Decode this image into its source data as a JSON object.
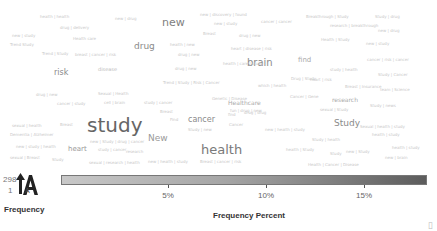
{
  "chart_data": {
    "type": "wordcloud",
    "title": "",
    "words": [
      {
        "text": "study",
        "size": 20,
        "color": "#666666",
        "x": 87,
        "y": 115
      },
      {
        "text": "health",
        "size": 13,
        "color": "#7a7a7a",
        "x": 201,
        "y": 143
      },
      {
        "text": "new",
        "size": 11,
        "color": "#808080",
        "x": 162,
        "y": 17
      },
      {
        "text": "brain",
        "size": 10,
        "color": "#8a8a8a",
        "x": 247,
        "y": 58
      },
      {
        "text": "Study",
        "size": 9,
        "color": "#8a8a8a",
        "x": 334,
        "y": 119
      },
      {
        "text": "drug",
        "size": 9,
        "color": "#8a8a8a",
        "x": 134,
        "y": 42
      },
      {
        "text": "New",
        "size": 9,
        "color": "#9a9a9a",
        "x": 148,
        "y": 134
      },
      {
        "text": "cancer",
        "size": 8,
        "color": "#8a8a8a",
        "x": 188,
        "y": 116
      },
      {
        "text": "risk",
        "size": 8,
        "color": "#8a8a8a",
        "x": 54,
        "y": 69
      },
      {
        "text": "heart",
        "size": 7,
        "color": "#9a9a9a",
        "x": 68,
        "y": 146
      },
      {
        "text": "find",
        "size": 7,
        "color": "#aaaaaa",
        "x": 298,
        "y": 57
      },
      {
        "text": "research",
        "size": 6,
        "color": "#aaaaaa",
        "x": 332,
        "y": 97
      },
      {
        "text": "Healthcare",
        "size": 6,
        "color": "#aaaaaa",
        "x": 228,
        "y": 100
      },
      {
        "text": "disease",
        "size": 5,
        "color": "#bbbbbb",
        "x": 98,
        "y": 67
      },
      {
        "text": "health | health",
        "size": 4,
        "color": "#c8c8c8",
        "x": 40,
        "y": 15
      },
      {
        "text": "new | drug",
        "size": 4,
        "color": "#c8c8c8",
        "x": 115,
        "y": 17
      },
      {
        "text": "drug | delivery",
        "size": 4,
        "color": "#c8c8c8",
        "x": 60,
        "y": 26
      },
      {
        "text": "new | study",
        "size": 4,
        "color": "#c8c8c8",
        "x": 12,
        "y": 34
      },
      {
        "text": "Health care",
        "size": 4,
        "color": "#c8c8c8",
        "x": 73,
        "y": 37
      },
      {
        "text": "Trend Study",
        "size": 4,
        "color": "#c8c8c8",
        "x": 10,
        "y": 43
      },
      {
        "text": "Trend | Study",
        "size": 4,
        "color": "#c8c8c8",
        "x": 42,
        "y": 52
      },
      {
        "text": "breast | cancer | risk",
        "size": 4,
        "color": "#c8c8c8",
        "x": 75,
        "y": 53
      },
      {
        "text": "new | discovery | found",
        "size": 4,
        "color": "#c8c8c8",
        "x": 200,
        "y": 13
      },
      {
        "text": "new | study",
        "size": 4,
        "color": "#c8c8c8",
        "x": 214,
        "y": 22
      },
      {
        "text": "cancer | cancer",
        "size": 4,
        "color": "#c8c8c8",
        "x": 261,
        "y": 20
      },
      {
        "text": "Breast",
        "size": 4,
        "color": "#c8c8c8",
        "x": 203,
        "y": 32
      },
      {
        "text": "drug | new",
        "size": 4,
        "color": "#c8c8c8",
        "x": 239,
        "y": 34
      },
      {
        "text": "health | new",
        "size": 4,
        "color": "#c8c8c8",
        "x": 170,
        "y": 43
      },
      {
        "text": "drug | new",
        "size": 4,
        "color": "#c8c8c8",
        "x": 178,
        "y": 53
      },
      {
        "text": "heart | disease | risk",
        "size": 4,
        "color": "#c8c8c8",
        "x": 231,
        "y": 47
      },
      {
        "text": "Breakthrough | Study",
        "size": 4,
        "color": "#c8c8c8",
        "x": 306,
        "y": 15
      },
      {
        "text": "research | breakthrough",
        "size": 4,
        "color": "#c8c8c8",
        "x": 330,
        "y": 24
      },
      {
        "text": "Study | drug",
        "size": 4,
        "color": "#c8c8c8",
        "x": 375,
        "y": 15
      },
      {
        "text": "new | drug",
        "size": 4,
        "color": "#c8c8c8",
        "x": 378,
        "y": 29
      },
      {
        "text": "Health | Study",
        "size": 4,
        "color": "#c8c8c8",
        "x": 321,
        "y": 38
      },
      {
        "text": "new | study",
        "size": 4,
        "color": "#c8c8c8",
        "x": 366,
        "y": 42
      },
      {
        "text": "health | care | study",
        "size": 4,
        "color": "#c8c8c8",
        "x": 223,
        "y": 62
      },
      {
        "text": "cancer | risk | cancer",
        "size": 4,
        "color": "#c8c8c8",
        "x": 367,
        "y": 58
      },
      {
        "text": "drug | new",
        "size": 4,
        "color": "#c8c8c8",
        "x": 175,
        "y": 67
      },
      {
        "text": "study | health",
        "size": 4,
        "color": "#c8c8c8",
        "x": 330,
        "y": 68
      },
      {
        "text": "heart | risk",
        "size": 4,
        "color": "#c8c8c8",
        "x": 310,
        "y": 78
      },
      {
        "text": "Study | Cancer",
        "size": 4,
        "color": "#c8c8c8",
        "x": 378,
        "y": 73
      },
      {
        "text": "Trend | Study | Risk | Cancer",
        "size": 4,
        "color": "#c8c8c8",
        "x": 163,
        "y": 81
      },
      {
        "text": "which | health",
        "size": 4,
        "color": "#c8c8c8",
        "x": 258,
        "y": 84
      },
      {
        "text": "Drug | Study",
        "size": 4,
        "color": "#c8c8c8",
        "x": 291,
        "y": 77
      },
      {
        "text": "Breast | Insurance",
        "size": 4,
        "color": "#c8c8c8",
        "x": 345,
        "y": 85
      },
      {
        "text": "team | Science",
        "size": 4,
        "color": "#c8c8c8",
        "x": 380,
        "y": 88
      },
      {
        "text": "drug | new",
        "size": 4,
        "color": "#c8c8c8",
        "x": 36,
        "y": 93
      },
      {
        "text": "Sexual | Health",
        "size": 4,
        "color": "#c8c8c8",
        "x": 98,
        "y": 92
      },
      {
        "text": "cancer | study",
        "size": 4,
        "color": "#c8c8c8",
        "x": 57,
        "y": 102
      },
      {
        "text": "cell | brain",
        "size": 4,
        "color": "#c8c8c8",
        "x": 104,
        "y": 101
      },
      {
        "text": "Genetic | Disease",
        "size": 4,
        "color": "#c8c8c8",
        "x": 212,
        "y": 97
      },
      {
        "text": "Cancer | Gene",
        "size": 4,
        "color": "#c8c8c8",
        "x": 290,
        "y": 95
      },
      {
        "text": "Study | news",
        "size": 4,
        "color": "#c8c8c8",
        "x": 370,
        "y": 104
      },
      {
        "text": "sexual | Study",
        "size": 4,
        "color": "#c8c8c8",
        "x": 320,
        "y": 108
      },
      {
        "text": "study | cancer",
        "size": 4,
        "color": "#c8c8c8",
        "x": 144,
        "y": 101
      },
      {
        "text": "fun | drug | new",
        "size": 4,
        "color": "#c8c8c8",
        "x": 230,
        "y": 109
      },
      {
        "text": "drug | drug",
        "size": 4,
        "color": "#c8c8c8",
        "x": 244,
        "y": 111
      },
      {
        "text": "Breast",
        "size": 4,
        "color": "#c8c8c8",
        "x": 160,
        "y": 110
      },
      {
        "text": "sexual | health",
        "size": 4,
        "color": "#c8c8c8",
        "x": 12,
        "y": 124
      },
      {
        "text": "Breast",
        "size": 4,
        "color": "#c8c8c8",
        "x": 60,
        "y": 123
      },
      {
        "text": "Find",
        "size": 4,
        "color": "#c8c8c8",
        "x": 170,
        "y": 118
      },
      {
        "text": "find",
        "size": 4,
        "color": "#c8c8c8",
        "x": 228,
        "y": 113
      },
      {
        "text": "Cancer",
        "size": 4,
        "color": "#c8c8c8",
        "x": 229,
        "y": 123
      },
      {
        "text": "Dementia | Alzheimer",
        "size": 4,
        "color": "#c8c8c8",
        "x": 10,
        "y": 133
      },
      {
        "text": "new | study | health",
        "size": 4,
        "color": "#c8c8c8",
        "x": 16,
        "y": 145
      },
      {
        "text": "new | Study | drug | cancer",
        "size": 4,
        "color": "#c8c8c8",
        "x": 90,
        "y": 140
      },
      {
        "text": "study | cancer",
        "size": 4,
        "color": "#c8c8c8",
        "x": 98,
        "y": 148
      },
      {
        "text": "research",
        "size": 4,
        "color": "#c8c8c8",
        "x": 126,
        "y": 150
      },
      {
        "text": "Study | new",
        "size": 4,
        "color": "#c8c8c8",
        "x": 188,
        "y": 128
      },
      {
        "text": "new | health | study",
        "size": 4,
        "color": "#c8c8c8",
        "x": 265,
        "y": 128
      },
      {
        "text": "Sexual | health | study",
        "size": 4,
        "color": "#c8c8c8",
        "x": 360,
        "y": 125
      },
      {
        "text": "health | study",
        "size": 4,
        "color": "#c8c8c8",
        "x": 372,
        "y": 133
      },
      {
        "text": "Study | health",
        "size": 4,
        "color": "#c8c8c8",
        "x": 312,
        "y": 138
      },
      {
        "text": "health | study",
        "size": 4,
        "color": "#c8c8c8",
        "x": 392,
        "y": 146
      },
      {
        "text": "sexual | Breast",
        "size": 4,
        "color": "#c8c8c8",
        "x": 10,
        "y": 156
      },
      {
        "text": "Study",
        "size": 4,
        "color": "#c8c8c8",
        "x": 52,
        "y": 158
      },
      {
        "text": "Study",
        "size": 4,
        "color": "#c8c8c8",
        "x": 330,
        "y": 152
      },
      {
        "text": "new | Study",
        "size": 4,
        "color": "#c8c8c8",
        "x": 346,
        "y": 150
      },
      {
        "text": "new | brain",
        "size": 4,
        "color": "#c8c8c8",
        "x": 385,
        "y": 156
      },
      {
        "text": "health | Study",
        "size": 4,
        "color": "#c8c8c8",
        "x": 286,
        "y": 148
      },
      {
        "text": "sexual | research | health",
        "size": 4,
        "color": "#c8c8c8",
        "x": 89,
        "y": 161
      },
      {
        "text": "new | health | study",
        "size": 4,
        "color": "#c8c8c8",
        "x": 148,
        "y": 160
      },
      {
        "text": "Breast | cancer | risk",
        "size": 4,
        "color": "#c8c8c8",
        "x": 200,
        "y": 160
      },
      {
        "text": "Health | Cancer | Disease",
        "size": 4,
        "color": "#c8c8c8",
        "x": 308,
        "y": 163
      }
    ],
    "legend": {
      "size_label": "Frequency",
      "size_max": "298",
      "size_min": "1",
      "color_label": "Frequency Percent",
      "color_ticks": [
        "5%",
        "10%",
        "15%"
      ],
      "color_range": [
        "#c8c8c8",
        "#5c5c5c"
      ]
    }
  },
  "legend": {
    "freq_max": "298",
    "freq_min": "1",
    "freq_label": "Frequency",
    "percent_label": "Frequency Percent",
    "ticks": [
      {
        "label": "5%",
        "x": 168
      },
      {
        "label": "10%",
        "x": 266
      },
      {
        "label": "15%",
        "x": 364
      }
    ]
  },
  "corner_glyph": "▯"
}
